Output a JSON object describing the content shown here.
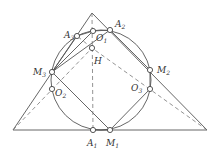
{
  "diagram": {
    "type": "geometry",
    "colors": {
      "line": "#555555",
      "dashed": "#777777",
      "point_fill": "#ffffff"
    },
    "triangle": {
      "apex": [
        92,
        13
      ],
      "left": [
        13,
        130
      ],
      "right": [
        207,
        130
      ]
    },
    "circle": {
      "cx": 101,
      "cy": 80,
      "r": 50
    },
    "points": [
      {
        "id": "A3",
        "x": 77,
        "y": 36,
        "label": "A",
        "sub": "3",
        "lx": 64,
        "ly": 38
      },
      {
        "id": "O1",
        "x": 93,
        "y": 31,
        "label": "O",
        "sub": "1",
        "lx": 96,
        "ly": 41
      },
      {
        "id": "A2",
        "x": 110,
        "y": 30,
        "label": "A",
        "sub": "2",
        "lx": 115,
        "ly": 27
      },
      {
        "id": "H",
        "x": 92,
        "y": 48,
        "label": "H",
        "sub": "",
        "lx": 94,
        "ly": 64
      },
      {
        "id": "M3",
        "x": 52,
        "y": 72,
        "label": "M",
        "sub": "3",
        "lx": 33,
        "ly": 75
      },
      {
        "id": "O2",
        "x": 52,
        "y": 89,
        "label": "O",
        "sub": "2",
        "lx": 55,
        "ly": 96
      },
      {
        "id": "M2",
        "x": 150,
        "y": 70,
        "label": "M",
        "sub": "2",
        "lx": 157,
        "ly": 73
      },
      {
        "id": "O3",
        "x": 150,
        "y": 89,
        "label": "O",
        "sub": "3",
        "lx": 131,
        "ly": 91
      },
      {
        "id": "A1",
        "x": 93,
        "y": 130,
        "label": "A",
        "sub": "1",
        "lx": 87,
        "ly": 146
      },
      {
        "id": "M1",
        "x": 110,
        "y": 130,
        "label": "M",
        "sub": "1",
        "lx": 106,
        "ly": 146
      }
    ]
  }
}
